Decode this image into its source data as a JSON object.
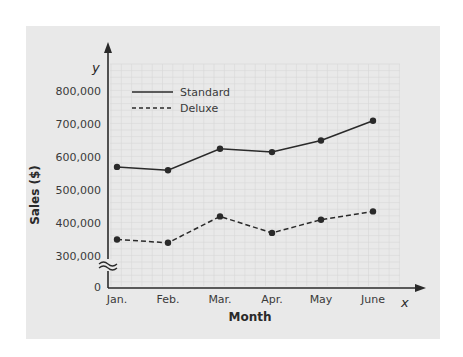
{
  "chart_data": {
    "type": "line",
    "title": "",
    "xlabel": "Month",
    "ylabel": "Sales ($)",
    "x_axis_variable": "x",
    "y_axis_variable": "y",
    "categories": [
      "Jan.",
      "Feb.",
      "Mar.",
      "Apr.",
      "May",
      "June"
    ],
    "y_ticks": [
      "0",
      "300,000",
      "400,000",
      "500,000",
      "600,000",
      "700,000",
      "800,000"
    ],
    "y_tick_values": [
      0,
      300000,
      400000,
      500000,
      600000,
      700000,
      800000
    ],
    "axis_break": "between 0 and 300,000",
    "ylim": [
      300000,
      800000
    ],
    "grid": true,
    "legend_position": "upper left",
    "series": [
      {
        "name": "Standard",
        "style": "solid",
        "values": [
          570000,
          560000,
          625000,
          615000,
          650000,
          710000
        ]
      },
      {
        "name": "Deluxe",
        "style": "dashed",
        "values": [
          350000,
          340000,
          420000,
          370000,
          410000,
          435000
        ]
      }
    ],
    "colors": {
      "background": "#e9e9e9",
      "line": "#2a2a2a",
      "grid": "#d6d6d6"
    }
  }
}
